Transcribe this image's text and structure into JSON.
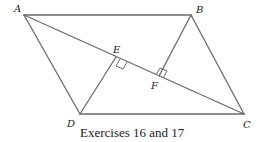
{
  "figure": {
    "caption": "Exercises 16 and 17",
    "labels": {
      "A": "A",
      "B": "B",
      "C": "C",
      "D": "D",
      "E": "E",
      "F": "F"
    },
    "stroke_color": "#6b6b6b",
    "text_color": "#222222"
  }
}
